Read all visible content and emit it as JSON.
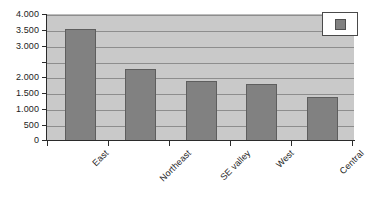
{
  "chart_data": {
    "type": "bar",
    "title": "",
    "subtitle": "",
    "xlabel": "",
    "ylabel": "",
    "categories": [
      "East",
      "Northeast",
      "SE valley",
      "West",
      "Central"
    ],
    "values": [
      3550,
      2300,
      1900,
      1800,
      1400
    ],
    "series": [
      {
        "name": "",
        "values": [
          3550,
          2300,
          1900,
          1800,
          1400
        ],
        "color": "#818181"
      }
    ],
    "ylim": [
      0,
      4000
    ],
    "y_tick_values": [
      0,
      500,
      1000,
      1500,
      2000,
      2500,
      3000,
      3500,
      4000
    ],
    "y_tick_labels": [
      "0",
      "500",
      "1.000",
      "1.500",
      "2.000",
      "",
      "3.000",
      "3.500",
      "4.000"
    ],
    "gridlines": "horizontal",
    "legend_position": "top-right",
    "legend_entries": [
      {
        "label": "",
        "color": "#818181"
      }
    ],
    "annotations": []
  },
  "style": {
    "plot_background": "#c9c9c9",
    "gridline_color": "#8d8d8d",
    "axis_color": "#2b2b2b",
    "bar_fill": "#818181",
    "bar_border": "#5e5e5e",
    "text_color": "#1c1c1c",
    "legend_background": "#ffffff",
    "figure_background": "#ffffff"
  },
  "legend": {
    "swatch_name": "series-color-swatch"
  }
}
